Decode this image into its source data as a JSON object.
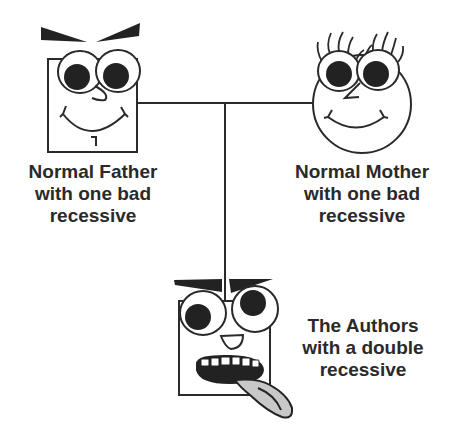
{
  "diagram": {
    "type": "pedigree",
    "colors": {
      "stroke": "#2a2a2a",
      "fill_dark": "#222222",
      "tongue": "#c8c8c8",
      "background": "#ffffff"
    },
    "father": {
      "shape": "square",
      "label_lines": [
        "Normal Father",
        "with one bad",
        "recessive"
      ]
    },
    "mother": {
      "shape": "circle",
      "label_lines": [
        "Normal Mother",
        "with one bad",
        "recessive"
      ]
    },
    "child": {
      "shape": "square",
      "label_lines": [
        "The Authors",
        "with a double",
        "recessive"
      ]
    }
  }
}
